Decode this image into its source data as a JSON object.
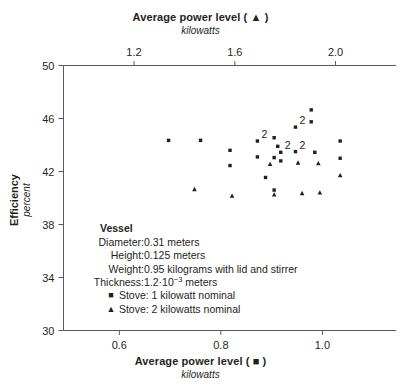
{
  "chart_data": {
    "type": "scatter",
    "title": "",
    "top_axis": {
      "label": "Average power level ( ▲ )",
      "units": "kilowatts",
      "ticks": [
        1.2,
        1.6,
        2.0
      ],
      "tick_labels": [
        "1.2",
        "1.6",
        "2.0"
      ],
      "range": [
        0.92,
        2.24
      ]
    },
    "bottom_axis": {
      "label": "Average power level ( ■ )",
      "units": "kilowatts",
      "ticks": [
        0.6,
        0.8,
        1.0
      ],
      "tick_labels": [
        "0.6",
        "0.8",
        "1.0"
      ],
      "range": [
        0.49,
        1.145
      ]
    },
    "yaxis": {
      "label": "Efficiency",
      "units": "percent",
      "ticks": [
        30,
        34,
        38,
        42,
        46,
        50
      ],
      "tick_labels": [
        "30",
        "34",
        "38",
        "42",
        "46",
        "50"
      ],
      "range": [
        30,
        50
      ]
    },
    "grid": false,
    "legend_position": "inside-lower-left",
    "series": [
      {
        "name": "Stove: 1 kilowatt nominal",
        "marker": "square",
        "axis": "bottom",
        "points": [
          {
            "x": 0.697,
            "y": 44.35
          },
          {
            "x": 0.76,
            "y": 44.35
          },
          {
            "x": 0.818,
            "y": 43.6
          },
          {
            "x": 0.818,
            "y": 42.45
          },
          {
            "x": 0.872,
            "y": 44.3,
            "label": "2"
          },
          {
            "x": 0.872,
            "y": 43.1
          },
          {
            "x": 0.888,
            "y": 41.55
          },
          {
            "x": 0.905,
            "y": 44.55
          },
          {
            "x": 0.912,
            "y": 43.9
          },
          {
            "x": 0.918,
            "y": 43.45,
            "label": "2"
          },
          {
            "x": 0.905,
            "y": 43.05
          },
          {
            "x": 0.918,
            "y": 42.8
          },
          {
            "x": 0.905,
            "y": 40.6
          },
          {
            "x": 0.947,
            "y": 45.35,
            "label": "2"
          },
          {
            "x": 0.947,
            "y": 43.5,
            "label": "2"
          },
          {
            "x": 0.978,
            "y": 46.65
          },
          {
            "x": 0.978,
            "y": 45.75
          },
          {
            "x": 0.985,
            "y": 43.45
          },
          {
            "x": 1.035,
            "y": 44.3
          },
          {
            "x": 1.035,
            "y": 43.0
          }
        ]
      },
      {
        "name": "Stove: 2 kilowatts nominal",
        "marker": "triangle",
        "axis": "bottom",
        "points": [
          {
            "x": 0.748,
            "y": 40.65
          },
          {
            "x": 0.822,
            "y": 40.15
          },
          {
            "x": 0.897,
            "y": 42.55
          },
          {
            "x": 0.905,
            "y": 40.25
          },
          {
            "x": 0.952,
            "y": 42.65
          },
          {
            "x": 0.96,
            "y": 40.35
          },
          {
            "x": 0.992,
            "y": 42.6
          },
          {
            "x": 0.995,
            "y": 40.4
          },
          {
            "x": 1.035,
            "y": 41.7
          }
        ]
      }
    ],
    "annotation": {
      "heading": "Vessel",
      "rows": [
        {
          "key": "Diameter:",
          "value": "0.31 meters"
        },
        {
          "key": "Height:",
          "value": "0.125 meters"
        },
        {
          "key": "Weight:",
          "value": "0.95 kilograms with lid and stirrer"
        },
        {
          "key": "Thickness:",
          "value": "1.2·10",
          "sup": "−3",
          "value_tail": " meters"
        }
      ],
      "legend": [
        {
          "marker": "■",
          "text": "Stove: 1 kilowatt nominal"
        },
        {
          "marker": "▲",
          "text": "Stove: 2 kilowatts nominal"
        }
      ]
    },
    "colors": {
      "marker": "#231f20",
      "axis": "#58595b",
      "text": "#231f20",
      "background": "#ffffff"
    }
  }
}
